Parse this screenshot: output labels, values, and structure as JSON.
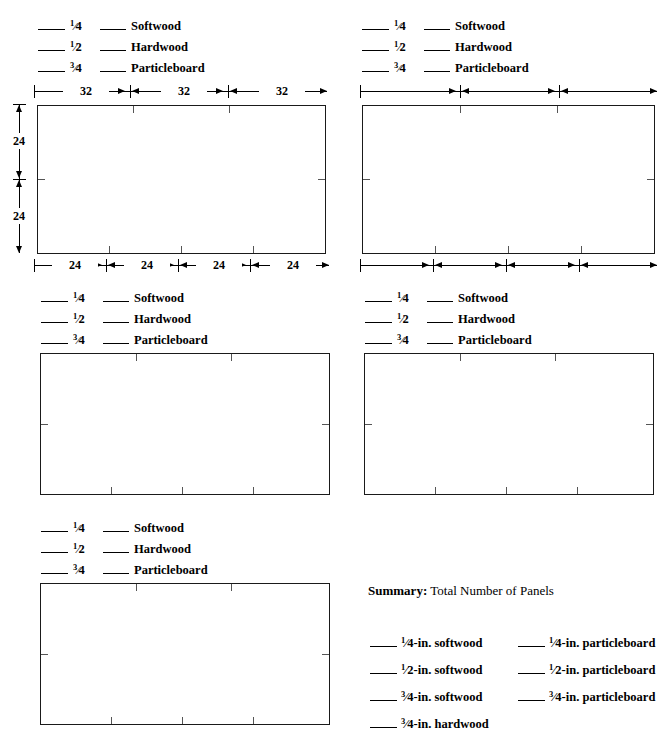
{
  "document": {
    "type": "worksheet",
    "title": "Panel Cutting Layout Worksheet"
  },
  "legend": {
    "thickness_blank": "____",
    "material_blank": "____",
    "rows": [
      {
        "num": "1",
        "slash": "⁄",
        "den": "4",
        "material": "Softwood"
      },
      {
        "num": "1",
        "slash": "⁄",
        "den": "2",
        "material": "Hardwood"
      },
      {
        "num": "3",
        "slash": "⁄",
        "den": "4",
        "material": "Particleboard"
      }
    ]
  },
  "panels": [
    {
      "id": "panel-1",
      "position": "top-left",
      "top_dimensions": {
        "values": [
          "32",
          "32",
          "32"
        ],
        "segments": 3
      },
      "bottom_dimensions": {
        "values": [
          "24",
          "24",
          "24",
          "24"
        ],
        "segments": 4
      },
      "left_dimensions": {
        "values": [
          "24",
          "24"
        ],
        "segments": 2
      },
      "has_left_dimension": true
    },
    {
      "id": "panel-2",
      "position": "top-right",
      "top_dimensions": {
        "values": [
          "",
          "",
          ""
        ],
        "segments": 3
      },
      "bottom_dimensions": {
        "values": [
          "",
          "",
          "",
          ""
        ],
        "segments": 4
      },
      "has_left_dimension": false
    },
    {
      "id": "panel-3",
      "position": "middle-left",
      "has_left_dimension": false
    },
    {
      "id": "panel-4",
      "position": "middle-right",
      "has_left_dimension": false
    },
    {
      "id": "panel-5",
      "position": "bottom-left",
      "has_left_dimension": false
    }
  ],
  "summary": {
    "title_lead": "Summary:",
    "title_rest": " Total Number of Panels",
    "blank": "____",
    "left_column": [
      {
        "num": "1",
        "slash": "⁄",
        "rest": "4-in. softwood"
      },
      {
        "num": "1",
        "slash": "⁄",
        "rest": "2-in. softwood"
      },
      {
        "num": "3",
        "slash": "⁄",
        "rest": "4-in. softwood"
      },
      {
        "num": "3",
        "slash": "⁄",
        "rest": "4-in. hardwood"
      }
    ],
    "right_column": [
      {
        "num": "1",
        "slash": "⁄",
        "rest": "4-in. particleboard"
      },
      {
        "num": "1",
        "slash": "⁄",
        "rest": "2-in. particleboard"
      },
      {
        "num": "3",
        "slash": "⁄",
        "rest": "4-in. particleboard"
      }
    ]
  },
  "colors": {
    "ink": "#000000",
    "panel_border": "#1a1a1a",
    "tick": "#555555",
    "background": "#ffffff"
  }
}
